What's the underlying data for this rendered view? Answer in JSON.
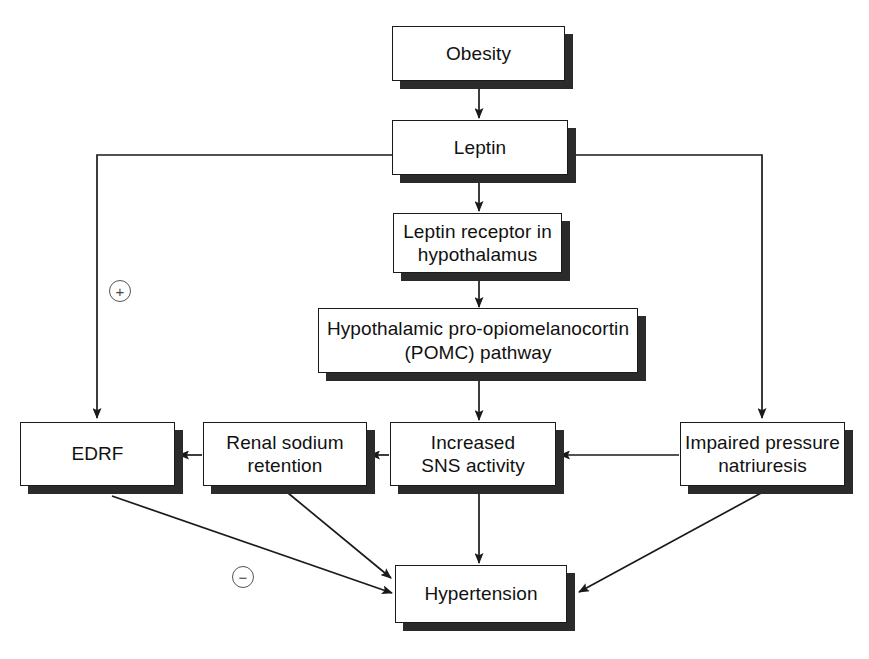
{
  "diagram": {
    "background_color": "#ffffff",
    "line_color": "#1a1a1a",
    "shadow_color": "#2b2b2b",
    "nodes": [
      {
        "id": "obesity",
        "label": "Obesity"
      },
      {
        "id": "leptin",
        "label": "Leptin"
      },
      {
        "id": "receptor",
        "label": "Leptin receptor in\nhypothalamus",
        "line1": "Leptin receptor in",
        "line2": "hypothalamus"
      },
      {
        "id": "pomc",
        "label": "Hypothalamic pro-opiomelanocortin\n(POMC) pathway",
        "line1": "Hypothalamic pro-opiomelanocortin",
        "line2": "(POMC) pathway"
      },
      {
        "id": "edrf",
        "label": "EDRF"
      },
      {
        "id": "renal",
        "label": "Renal sodium\nretention",
        "line1": "Renal sodium",
        "line2": "retention"
      },
      {
        "id": "sns",
        "label": "Increased\nSNS activity",
        "line1": "Increased",
        "line2": "SNS activity"
      },
      {
        "id": "natriuresis",
        "label": "Impaired pressure\nnatriuresis",
        "line1": "Impaired pressure",
        "line2": "natriuresis"
      },
      {
        "id": "hypertension",
        "label": "Hypertension"
      }
    ],
    "signs": [
      {
        "id": "plus",
        "symbol": "+",
        "meaning": "stimulatory"
      },
      {
        "id": "minus",
        "symbol": "−",
        "meaning": "inhibitory"
      }
    ],
    "edges": [
      {
        "from": "obesity",
        "to": "leptin",
        "style": "arrow-down"
      },
      {
        "from": "leptin",
        "to": "receptor",
        "style": "arrow-down"
      },
      {
        "from": "receptor",
        "to": "pomc",
        "style": "arrow-down"
      },
      {
        "from": "pomc",
        "to": "sns",
        "style": "arrow-down"
      },
      {
        "from": "leptin",
        "to": "edrf",
        "style": "elbow-left-down",
        "sign": "+"
      },
      {
        "from": "leptin",
        "to": "natriuresis",
        "style": "elbow-right-down"
      },
      {
        "from": "sns",
        "to": "renal",
        "style": "arrow-left"
      },
      {
        "from": "renal",
        "to": "edrf",
        "style": "arrow-left"
      },
      {
        "from": "natriuresis",
        "to": "sns",
        "style": "arrow-left"
      },
      {
        "from": "sns",
        "to": "hypertension",
        "style": "arrow-down"
      },
      {
        "from": "edrf",
        "to": "hypertension",
        "style": "arrow-diagonal",
        "sign": "−"
      },
      {
        "from": "renal",
        "to": "hypertension",
        "style": "arrow-diagonal"
      },
      {
        "from": "natriuresis",
        "to": "hypertension",
        "style": "arrow-diagonal"
      }
    ]
  }
}
